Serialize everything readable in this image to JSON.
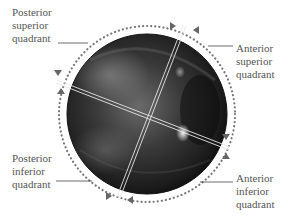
{
  "figure": {
    "labels": {
      "posterior_superior": [
        "Posterior",
        "superior",
        "quadrant"
      ],
      "anterior_superior": [
        "Anterior",
        "superior",
        "quadrant"
      ],
      "posterior_inferior": [
        "Posterior",
        "inferior",
        "quadrant"
      ],
      "anterior_inferior": [
        "Anterior",
        "inferior",
        "quadrant"
      ]
    },
    "colors": {
      "text": "#555555",
      "leader": "#444444",
      "dots": "#777777",
      "divider": "#e8e8e8"
    }
  }
}
